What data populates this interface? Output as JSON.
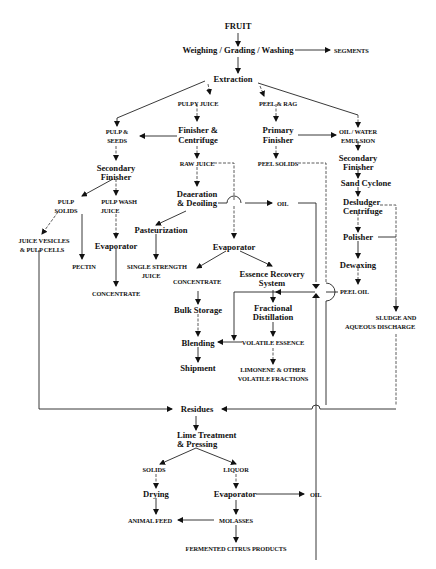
{
  "nodes": {
    "fruit": "FRUIT",
    "weighing": "Weighing / Grading / Washing",
    "segments": "SEGMENTS",
    "extraction": "Extraction",
    "pulpy_juice": "PULPY JUICE",
    "peel_rag": "PEEL & RAG",
    "pulp_seeds_1": "PULP &",
    "pulp_seeds_2": "SEEDS",
    "finisher_centrifuge_1": "Finisher &",
    "finisher_centrifuge_2": "Centrifuge",
    "primary_finisher_1": "Primary",
    "primary_finisher_2": "Finisher",
    "oil_water_1": "OIL / WATER",
    "oil_water_2": "EMULSION",
    "secondary_finisher_l_1": "Secondary",
    "secondary_finisher_l_2": "Finisher",
    "raw_juice": "RAW JUICE",
    "peel_solids": "PEEL SOLIDS",
    "secondary_finisher_r_1": "Secondary",
    "secondary_finisher_r_2": "Finisher",
    "sand_cyclone": "Sand Cyclone",
    "pulp_solids_1": "PULP",
    "pulp_solids_2": "SOLIDS",
    "pulp_wash_1": "PULP WASH",
    "pulp_wash_2": "JUICE",
    "deaeration_1": "Deaeration",
    "deaeration_2": "& Deoiling",
    "oil_top": "OIL",
    "desludger_1": "Desludger",
    "desludger_2": "Centrifuge",
    "juice_vesicles_1": "JUICE VESICLES",
    "juice_vesicles_2": "& PULP CELLS",
    "evaporator_left": "Evaporator",
    "pasteurization": "Pasteurization",
    "polisher": "Polisher",
    "pectin": "PECTIN",
    "single_strength_1": "SINGLE STRENGTH",
    "single_strength_2": "JUICE",
    "evaporator_mid": "Evaporator",
    "dewaxing": "Dewaxing",
    "concentrate_left": "CONCENTRATE",
    "concentrate_mid": "CONCENTRATE",
    "essence_recovery_1": "Essence Recovery",
    "essence_recovery_2": "System",
    "peel_oil": "PEEL OIL",
    "bulk_storage": "Bulk Storage",
    "fractional_1": "Fractional",
    "fractional_2": "Distillation",
    "sludge_1": "SLUDGE AND",
    "sludge_2": "AQUEOUS DISCHARGE",
    "blending": "Blending",
    "volatile_essence": "VOLATILE ESSENCE",
    "shipment": "Shipment",
    "limonene_1": "LIMONENE & OTHER",
    "limonene_2": "VOLATILE FRACTIONS",
    "residues": "Residues",
    "lime_1": "Lime Treatment",
    "lime_2": "& Pressing",
    "solids": "SOLIDS",
    "liquor": "LIQUOR",
    "drying": "Drying",
    "evaporator_bottom": "Evaporator",
    "oil_bottom": "OIL",
    "animal_feed": "ANIMAL FEED",
    "molasses": "MOLASSES",
    "fermented": "FERMENTED CITRUS PRODUCTS"
  }
}
